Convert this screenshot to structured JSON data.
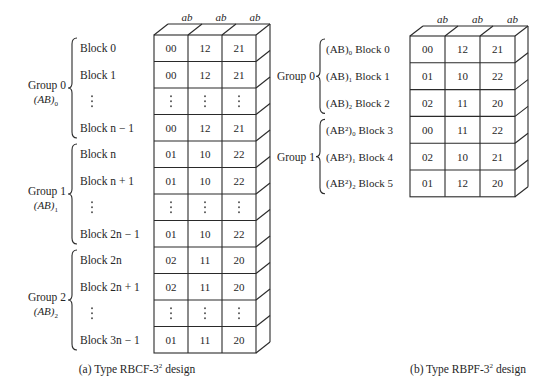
{
  "figure": {
    "column_header": "ab",
    "left_panel": {
      "caption": "(a) Type RBCF-3",
      "caption_sup": "2",
      "caption_tail": " design",
      "groups": [
        {
          "label": "Group 0",
          "effect": "(AB)",
          "effect_sub": "0",
          "rows": [
            {
              "block": "Block 0",
              "cells": [
                "00",
                "12",
                "21"
              ]
            },
            {
              "block": "Block 1",
              "cells": [
                "00",
                "12",
                "21"
              ]
            },
            {
              "block": "⋮",
              "cells": [
                "⋮",
                "⋮",
                "⋮"
              ]
            },
            {
              "block": "Block n − 1",
              "cells": [
                "00",
                "12",
                "21"
              ]
            }
          ]
        },
        {
          "label": "Group 1",
          "effect": "(AB)",
          "effect_sub": "1",
          "rows": [
            {
              "block": "Block n",
              "cells": [
                "01",
                "10",
                "22"
              ]
            },
            {
              "block": "Block n + 1",
              "cells": [
                "01",
                "10",
                "22"
              ]
            },
            {
              "block": "⋮",
              "cells": [
                "⋮",
                "⋮",
                "⋮"
              ]
            },
            {
              "block": "Block 2n − 1",
              "cells": [
                "01",
                "10",
                "22"
              ]
            }
          ]
        },
        {
          "label": "Group 2",
          "effect": "(AB)",
          "effect_sub": "2",
          "rows": [
            {
              "block": "Block 2n",
              "cells": [
                "02",
                "11",
                "20"
              ]
            },
            {
              "block": "Block 2n + 1",
              "cells": [
                "02",
                "11",
                "20"
              ]
            },
            {
              "block": "⋮",
              "cells": [
                "⋮",
                "⋮",
                "⋮"
              ]
            },
            {
              "block": "Block 3n − 1",
              "cells": [
                "01",
                "11",
                "20"
              ]
            }
          ]
        }
      ]
    },
    "right_panel": {
      "caption": "(b) Type RBPF-3",
      "caption_sup": "2",
      "caption_tail": " design",
      "groups": [
        {
          "label": "Group 0",
          "rows": [
            {
              "block": "(AB)₀ Block 0",
              "cells": [
                "00",
                "12",
                "21"
              ]
            },
            {
              "block": "(AB)₁ Block 1",
              "cells": [
                "01",
                "10",
                "22"
              ]
            },
            {
              "block": "(AB)₂ Block 2",
              "cells": [
                "02",
                "11",
                "20"
              ]
            }
          ]
        },
        {
          "label": "Group 1",
          "rows": [
            {
              "block": "(AB²)₀ Block 3",
              "cells": [
                "00",
                "11",
                "22"
              ]
            },
            {
              "block": "(AB²)₁ Block 4",
              "cells": [
                "02",
                "10",
                "21"
              ]
            },
            {
              "block": "(AB²)₂ Block 5",
              "cells": [
                "01",
                "12",
                "20"
              ]
            }
          ]
        }
      ]
    }
  }
}
